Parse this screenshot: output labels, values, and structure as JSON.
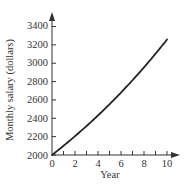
{
  "chart_data": {
    "type": "line",
    "title": "",
    "xlabel": "Year",
    "ylabel": "Monthly salary (dollars)",
    "xlim": [
      0,
      10
    ],
    "ylim": [
      2000,
      3400
    ],
    "x_ticks": [
      0,
      2,
      4,
      6,
      8,
      10
    ],
    "x_minor_ticks": [
      1,
      2,
      3,
      4,
      5,
      6,
      7,
      8,
      9,
      10
    ],
    "y_ticks": [
      2000,
      2200,
      2400,
      2600,
      2800,
      3000,
      3200,
      3400
    ],
    "grid": false,
    "legend": null,
    "series": [
      {
        "name": "Monthly salary",
        "x": [
          0,
          1,
          2,
          3,
          4,
          5,
          6,
          7,
          8,
          9,
          10
        ],
        "values": [
          2000,
          2100,
          2205,
          2315,
          2431,
          2553,
          2680,
          2814,
          2955,
          3103,
          3258
        ]
      }
    ]
  },
  "labels": {
    "xlabel": "Year",
    "ylabel": "Monthly salary (dollars)",
    "x_tick_labels": [
      "0",
      "2",
      "4",
      "6",
      "8",
      "10"
    ],
    "y_tick_labels": [
      "2000",
      "2200",
      "2400",
      "2600",
      "2800",
      "3000",
      "3200",
      "3400"
    ]
  },
  "colors": {
    "axis": "#333333",
    "line": "#222222",
    "background": "#ffffff"
  }
}
